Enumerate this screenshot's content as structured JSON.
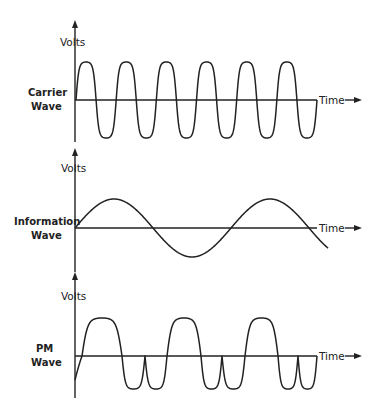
{
  "panels": [
    {
      "id": "carrier",
      "label_line1": "Carrier",
      "label_line2": "Wave",
      "y_axis_label": "Volts",
      "x_axis_label": "Time",
      "description": "High-frequency sinusoid, 6 full cycles"
    },
    {
      "id": "information",
      "label_line1": "Information",
      "label_line2": "Wave",
      "y_axis_label": "Volts",
      "x_axis_label": "Time",
      "description": "Low-frequency sinusoid, about 1.6 cycles"
    },
    {
      "id": "pm",
      "label_line1": "PM",
      "label_line2": "Wave",
      "y_axis_label": "Volts",
      "x_axis_label": "Time",
      "description": "Phase-modulated carrier with cusps between negative lobes"
    }
  ],
  "colors": {
    "line": "#222222",
    "background": "#ffffff"
  }
}
